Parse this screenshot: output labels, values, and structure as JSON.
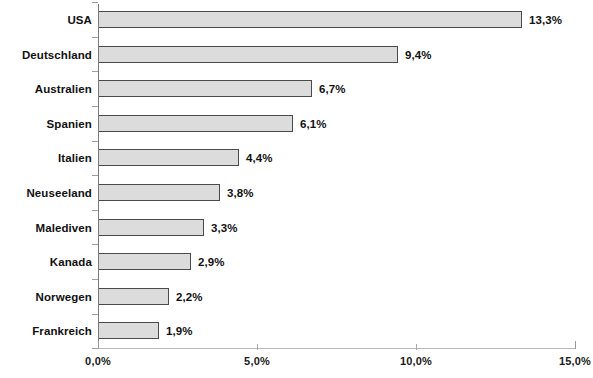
{
  "chart_data": {
    "type": "bar",
    "orientation": "horizontal",
    "title": "",
    "subtitle": "",
    "xlabel": "",
    "ylabel": "",
    "xlim": [
      0,
      15
    ],
    "grid": false,
    "legend": null,
    "value_suffix": "%",
    "decimal_separator": ",",
    "xtick_labels": [
      "0,0%",
      "5,0%",
      "10,0%",
      "15,0%"
    ],
    "xtick_values": [
      0,
      5,
      10,
      15
    ],
    "categories": [
      "USA",
      "Deutschland",
      "Australien",
      "Spanien",
      "Italien",
      "Neuseeland",
      "Malediven",
      "Kanada",
      "Norwegen",
      "Frankreich"
    ],
    "values": [
      13.3,
      9.4,
      6.7,
      6.1,
      4.4,
      3.8,
      3.3,
      2.9,
      2.2,
      1.9
    ],
    "data_labels": [
      "13,3%",
      "9,4%",
      "6,7%",
      "6,1%",
      "4,4%",
      "3,8%",
      "3,3%",
      "2,9%",
      "2,2%",
      "1,9%"
    ],
    "colors": {
      "bar_fill": "#dcdcdc",
      "bar_border": "#4a4a4a",
      "axis": "#7a7a7a",
      "text": "#111111"
    }
  }
}
